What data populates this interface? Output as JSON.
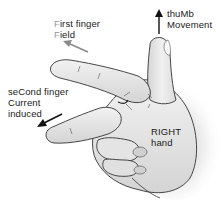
{
  "labels": {
    "first_finger": {
      "line1_highlight": "F",
      "line1_rest": "irst finger",
      "line2_highlight": "F",
      "line2_rest": "ield"
    },
    "second_finger": {
      "line1_pre": "se",
      "line1_highlight": "C",
      "line1_rest": "ond finger",
      "line2_highlight": "C",
      "line2_rest": "urrent",
      "line3": "induced"
    },
    "thumb": {
      "line1_pre": "thu",
      "line1_highlight": "M",
      "line1_rest": "b",
      "line2_highlight": "M",
      "line2_rest": "ovement"
    },
    "hand": {
      "line1": "RIGHT",
      "line2": "hand"
    }
  },
  "colors": {
    "field_arrow": "#8a8a8a",
    "current_arrow": "#111111",
    "movement_arrow": "#111111",
    "skin_fill": "#e6e6e6",
    "outline": "#333333",
    "shadow": "#c8c8c8",
    "highlight_letter": "#9a9a9a"
  }
}
